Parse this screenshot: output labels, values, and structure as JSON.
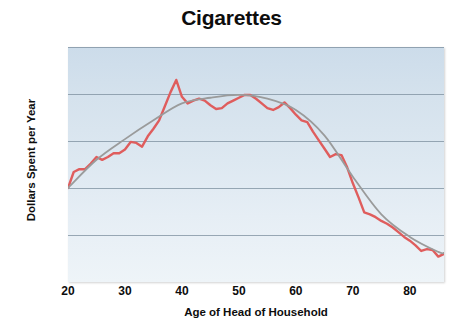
{
  "chart_data": {
    "type": "line",
    "title": "Cigarettes",
    "xlabel": "Age of Head of Household",
    "ylabel": "Dollars Spent per Year",
    "xlim": [
      20,
      86
    ],
    "ylim": [
      0,
      2.5
    ],
    "grid": true,
    "legend": "none",
    "x_ticks": [
      "20",
      "30",
      "40",
      "50",
      "60",
      "70",
      "80"
    ],
    "x_tick_values": [
      20,
      30,
      40,
      50,
      60,
      70,
      80
    ],
    "y_ticks": [
      "0",
      "0.5",
      "1.0",
      "1.5",
      "2.0",
      "2.5"
    ],
    "y_tick_values": [
      0,
      0.5,
      1.0,
      1.5,
      2.0,
      2.5
    ],
    "colors": {
      "observed": "#df5d5d",
      "smoothed": "#9a9b9b",
      "plot_background_top": "#ccdcea",
      "plot_background_bottom": "#eef4f8",
      "gridline": "#7c8f9e",
      "text": "#0d0d0d"
    },
    "series": [
      {
        "name": "Observed spending",
        "style": "jagged-line",
        "color": "#df5d5d",
        "x": [
          20,
          21,
          22,
          23,
          24,
          25,
          26,
          27,
          28,
          29,
          30,
          31,
          32,
          33,
          34,
          35,
          36,
          37,
          38,
          39,
          40,
          41,
          42,
          43,
          44,
          45,
          46,
          47,
          48,
          49,
          50,
          51,
          52,
          53,
          54,
          55,
          56,
          57,
          58,
          59,
          60,
          61,
          62,
          63,
          64,
          65,
          66,
          67,
          68,
          69,
          70,
          71,
          72,
          73,
          74,
          75,
          76,
          77,
          78,
          79,
          80,
          81,
          82,
          83,
          84,
          85,
          86
        ],
        "values": [
          1.0,
          1.17,
          1.2,
          1.2,
          1.26,
          1.33,
          1.3,
          1.33,
          1.37,
          1.37,
          1.41,
          1.49,
          1.48,
          1.44,
          1.55,
          1.63,
          1.72,
          1.87,
          2.02,
          2.15,
          1.97,
          1.9,
          1.93,
          1.95,
          1.93,
          1.88,
          1.84,
          1.85,
          1.9,
          1.93,
          1.96,
          1.99,
          1.99,
          1.95,
          1.9,
          1.85,
          1.83,
          1.86,
          1.91,
          1.85,
          1.78,
          1.72,
          1.7,
          1.6,
          1.51,
          1.42,
          1.33,
          1.36,
          1.35,
          1.22,
          1.05,
          0.9,
          0.74,
          0.72,
          0.69,
          0.65,
          0.62,
          0.58,
          0.53,
          0.48,
          0.44,
          0.39,
          0.33,
          0.35,
          0.34,
          0.27,
          0.3
        ]
      },
      {
        "name": "Smoothed trend",
        "style": "smooth-curve",
        "color": "#9a9b9b",
        "x": [
          20,
          25,
          30,
          35,
          40,
          45,
          50,
          55,
          60,
          65,
          70,
          75,
          80,
          85,
          86
        ],
        "values": [
          1.0,
          1.3,
          1.52,
          1.72,
          1.9,
          1.96,
          1.99,
          1.95,
          1.83,
          1.56,
          1.12,
          0.72,
          0.48,
          0.32,
          0.31
        ]
      }
    ]
  }
}
